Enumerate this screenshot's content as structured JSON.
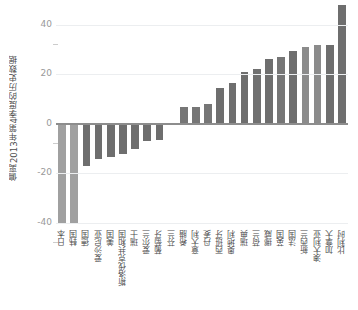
{
  "chart_data": {
    "type": "bar",
    "title": "",
    "subtitle": "",
    "xlabel": "",
    "ylabel": "偏离2013年第4季度的历史数据",
    "ylim": [
      -42,
      50
    ],
    "yticks": [
      40,
      20,
      0,
      -20,
      -40
    ],
    "ytick_labels": [
      "40",
      "20",
      "0",
      "-20",
      "-40"
    ],
    "grid": true,
    "legend": null,
    "orientation": "vertical",
    "bar_color": "#737373",
    "highlight_color": "#a0a0a0",
    "zero_line_color": "#8d8d8d",
    "gridline_color": "#eceef0",
    "categories": [
      "日本",
      "韩国",
      "德国",
      "爱沙尼亚",
      "美国",
      "斯洛伐克共和国",
      "瑞士",
      "爱尔兰",
      "葡萄牙",
      "芬兰",
      "希腊",
      "意大利",
      "丹麦",
      "西班牙",
      "奥地利",
      "瑞典",
      "荷兰",
      "挪威",
      "英国",
      "法国",
      "新西兰",
      "澳大利亚",
      "加拿大",
      "比利时"
    ],
    "values": [
      -40.0,
      -40.0,
      -17.0,
      -14.0,
      -13.5,
      -12.0,
      -10.0,
      -7.0,
      -6.5,
      -0.3,
      7.0,
      7.0,
      8.0,
      14.5,
      16.5,
      21.0,
      22.0,
      26.0,
      27.0,
      29.5,
      31.0,
      32.0,
      32.0,
      48.0
    ],
    "bar_shades": [
      "#a0a0a0",
      "#a0a0a0",
      "#6e6e6e",
      "#6e6e6e",
      "#6e6e6e",
      "#6e6e6e",
      "#6e6e6e",
      "#6e6e6e",
      "#6e6e6e",
      "#6e6e6e",
      "#767676",
      "#767676",
      "#767676",
      "#6e6e6e",
      "#6e6e6e",
      "#6e6e6e",
      "#707070",
      "#6e6e6e",
      "#767676",
      "#6e6e6e",
      "#8b8b8b",
      "#8b8b8b",
      "#6e6e6e",
      "#6e6e6e"
    ]
  }
}
